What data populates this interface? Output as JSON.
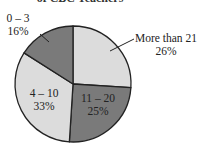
{
  "chart_data": {
    "type": "pie",
    "title": "of CBC Teachers",
    "categories": [
      "More than 21",
      "11 – 20",
      "4 – 10",
      "0 – 3"
    ],
    "values": [
      26,
      25,
      33,
      16
    ],
    "value_labels": [
      "26%",
      "25%",
      "33%",
      "16%"
    ],
    "colors": [
      "#dcdcdc",
      "#7a7a7a",
      "#dcdcdc",
      "#7a7a7a"
    ],
    "start_angle": "12 o'clock",
    "direction": "clockwise",
    "legend": "none (direct labels)"
  },
  "labels": {
    "more21": {
      "name": "More than 21",
      "pct": "26%"
    },
    "s11_20": {
      "name": "11 – 20",
      "pct": "25%"
    },
    "s4_10": {
      "name": "4 – 10",
      "pct": "33%"
    },
    "s0_3": {
      "name": "0 – 3",
      "pct": "16%"
    }
  }
}
